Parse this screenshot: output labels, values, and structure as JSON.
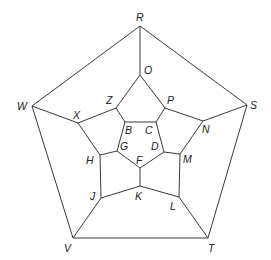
{
  "diagram": {
    "type": "dodecahedron-graph (Schlegel diagram)",
    "vertices": {
      "R": {
        "x": 140,
        "y": 26,
        "lx": 136,
        "ly": 21
      },
      "O": {
        "x": 140,
        "y": 75,
        "lx": 144,
        "ly": 74
      },
      "W": {
        "x": 32,
        "y": 106,
        "lx": 17,
        "ly": 110
      },
      "S": {
        "x": 247,
        "y": 105,
        "lx": 250,
        "ly": 109
      },
      "Z": {
        "x": 116,
        "y": 108,
        "lx": 106,
        "ly": 104
      },
      "P": {
        "x": 165,
        "y": 108,
        "lx": 167,
        "ly": 104
      },
      "X": {
        "x": 78,
        "y": 123,
        "lx": 73,
        "ly": 119
      },
      "N": {
        "x": 203,
        "y": 121,
        "lx": 202,
        "ly": 133
      },
      "B": {
        "x": 125,
        "y": 122,
        "lx": 125,
        "ly": 134
      },
      "C": {
        "x": 156,
        "y": 122,
        "lx": 145,
        "ly": 134
      },
      "G": {
        "x": 117,
        "y": 151,
        "lx": 120,
        "ly": 150
      },
      "D": {
        "x": 164,
        "y": 152,
        "lx": 151,
        "ly": 150
      },
      "H": {
        "x": 100,
        "y": 155,
        "lx": 86,
        "ly": 164
      },
      "M": {
        "x": 180,
        "y": 154,
        "lx": 183,
        "ly": 163
      },
      "F": {
        "x": 140,
        "y": 168,
        "lx": 136,
        "ly": 164
      },
      "K": {
        "x": 140,
        "y": 186,
        "lx": 135,
        "ly": 200
      },
      "J": {
        "x": 101,
        "y": 198,
        "lx": 90,
        "ly": 200
      },
      "L": {
        "x": 179,
        "y": 197,
        "lx": 170,
        "ly": 210
      },
      "V": {
        "x": 73,
        "y": 238,
        "lx": 64,
        "ly": 252
      },
      "T": {
        "x": 208,
        "y": 238,
        "lx": 208,
        "ly": 252
      }
    },
    "edges": [
      [
        "R",
        "W"
      ],
      [
        "R",
        "S"
      ],
      [
        "R",
        "O"
      ],
      [
        "W",
        "V"
      ],
      [
        "S",
        "T"
      ],
      [
        "V",
        "T"
      ],
      [
        "W",
        "X"
      ],
      [
        "S",
        "N"
      ],
      [
        "V",
        "J"
      ],
      [
        "T",
        "L"
      ],
      [
        "O",
        "Z"
      ],
      [
        "O",
        "P"
      ],
      [
        "Z",
        "X"
      ],
      [
        "P",
        "N"
      ],
      [
        "Z",
        "B"
      ],
      [
        "P",
        "C"
      ],
      [
        "X",
        "H"
      ],
      [
        "N",
        "M"
      ],
      [
        "H",
        "J"
      ],
      [
        "M",
        "L"
      ],
      [
        "J",
        "K"
      ],
      [
        "L",
        "K"
      ],
      [
        "K",
        "F"
      ],
      [
        "B",
        "C"
      ],
      [
        "C",
        "D"
      ],
      [
        "D",
        "F"
      ],
      [
        "F",
        "G"
      ],
      [
        "G",
        "B"
      ],
      [
        "G",
        "H"
      ],
      [
        "D",
        "M"
      ]
    ]
  }
}
